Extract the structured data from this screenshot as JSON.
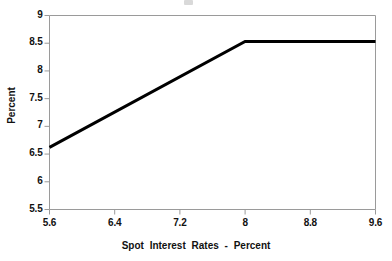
{
  "chart_data": {
    "type": "line",
    "title": "",
    "xlabel": "Spot Interest Rates - Percent",
    "ylabel": "Percent",
    "xlim": [
      5.6,
      9.6
    ],
    "ylim": [
      5.5,
      9.0
    ],
    "xticks": [
      "5.6",
      "6.4",
      "7.2",
      "8",
      "8.8",
      "9.6"
    ],
    "yticks": [
      "5.5",
      "6",
      "6.5",
      "7",
      "7.5",
      "8",
      "8.5",
      "9"
    ],
    "xtick_values": [
      5.6,
      6.4,
      7.2,
      8.0,
      8.8,
      9.6
    ],
    "ytick_values": [
      5.5,
      6.0,
      6.5,
      7.0,
      7.5,
      8.0,
      8.5,
      9.0
    ],
    "grid": false,
    "legend": "none",
    "series": [
      {
        "name": "Payoff",
        "color": "#000000",
        "x": [
          5.6,
          8.0,
          9.6
        ],
        "values": [
          6.62,
          8.53,
          8.53
        ]
      }
    ],
    "annotations": [],
    "axis_color": "#9a9a9a",
    "line_color": "#000000"
  },
  "plot": {
    "left_axis_name": "y-axis",
    "bottom_axis_name": "x-axis"
  }
}
